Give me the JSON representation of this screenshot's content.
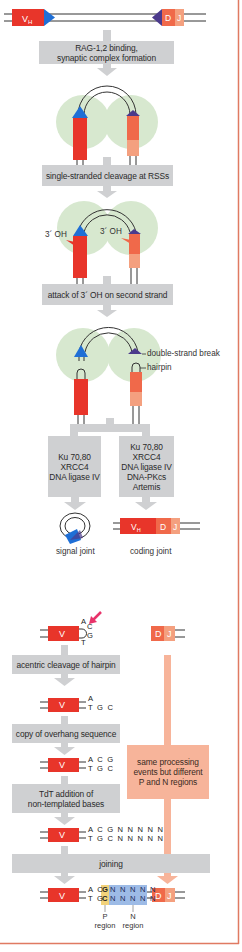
{
  "colors": {
    "v_segment": "#e8352a",
    "d_segment": "#f0694a",
    "j_segment": "#f4a07f",
    "rss_v": "#1f6fd6",
    "rss_dj": "#4b3a8c",
    "rag_complex": "#d7e8cf",
    "step_box": "#cfd0d2",
    "orange_box": "#f7b49a",
    "p_region": "#f2d27a",
    "n_region": "#9dbbe6",
    "cleavage_arrow": "#e8336a",
    "frame": "#e07a62"
  },
  "segments": {
    "vh_label": "V",
    "vh_sub": "H",
    "d_label": "D",
    "j_label": "J",
    "v_label": "V"
  },
  "steps": {
    "rag_binding": [
      "RAG-1,2 binding,",
      "synaptic complex formation"
    ],
    "single_strand": "single-stranded cleavage at RSSs",
    "attack": "attack of 3´ OH on second strand",
    "signal_proteins": [
      "Ku 70,80",
      "XRCC4",
      "DNA ligase IV"
    ],
    "coding_proteins": [
      "Ku 70,80",
      "XRCC4",
      "DNA ligase IV",
      "DNA-PKcs",
      "Artemis"
    ],
    "acentric": "acentric cleavage of hairpin",
    "copy_overhang": "copy of overhang sequence",
    "tdt": [
      "TdT addition of",
      "non-templated bases"
    ],
    "joining": "joining",
    "same_processing": [
      "same processing",
      "events but different",
      "P and N regions"
    ]
  },
  "annotations": {
    "oh_left": "3´ OH",
    "oh_right": "3´ OH",
    "double_strand_break": "double-strand break",
    "hairpin": "hairpin",
    "signal_joint": "signal joint",
    "coding_joint": "coding joint",
    "p_region": [
      "P",
      "region"
    ],
    "n_region": [
      "N",
      "region"
    ]
  },
  "sequences": {
    "hairpin": {
      "top": "A",
      "loop_top": "C",
      "loop_bottom": "G",
      "bottom": "T"
    },
    "after_cleavage": {
      "top": "A",
      "bottom": "T G C"
    },
    "after_copy": {
      "top": "A C G",
      "bottom": "T G C"
    },
    "after_tdt": {
      "top": "A C G N N N N N",
      "bottom": "T G C N N N N N"
    },
    "final": {
      "top_plain": "A C",
      "bottom_plain": "T G",
      "p_top": "G",
      "p_bottom": "C",
      "n_top": "N N N N N",
      "n_bottom": "N N N N N"
    }
  }
}
